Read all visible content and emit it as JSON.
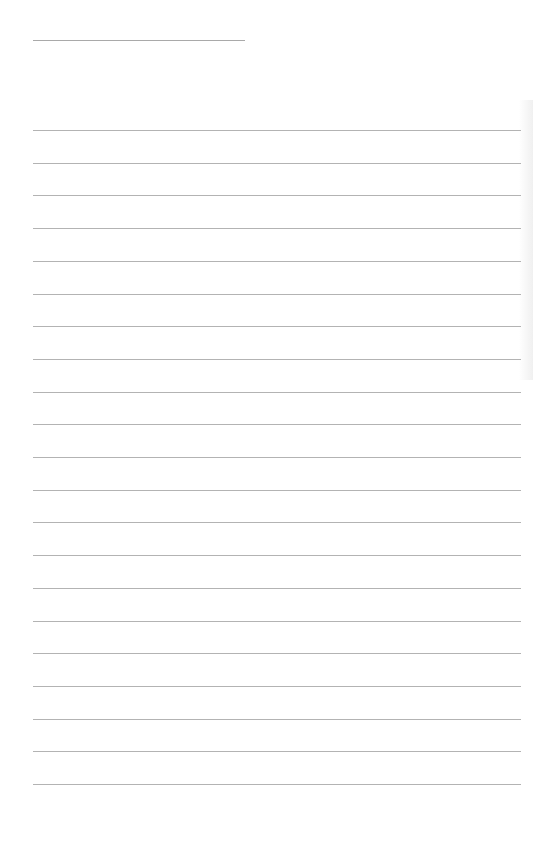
{
  "document": {
    "type": "lined-paper",
    "header_line": {
      "x": 33,
      "y": 40,
      "width": 212
    },
    "rules": {
      "count": 21,
      "first_y": 130,
      "spacing": 32.7,
      "x": 33,
      "width": 488
    },
    "colors": {
      "background": "#ffffff",
      "rule": "#b3b3b3",
      "header_rule": "#a9a9a9"
    },
    "text": []
  }
}
